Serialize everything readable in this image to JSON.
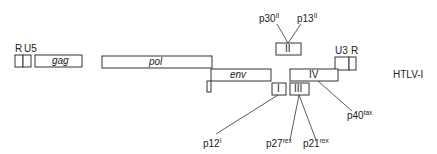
{
  "diagram": {
    "title": "HTLV-I",
    "genes": {
      "R_left": "R",
      "U5": "U5",
      "gag": "gag",
      "pol": "pol",
      "env": "env",
      "U3": "U3",
      "R_right": "R",
      "orf_I": "I",
      "orf_II": "II",
      "orf_III": "III",
      "orf_IV": "IV"
    },
    "proteins": {
      "p30": {
        "base": "p30",
        "sup": "II"
      },
      "p13": {
        "base": "p13",
        "sup": "II"
      },
      "p12": {
        "base": "p12",
        "sup": "I"
      },
      "p27": {
        "base": "p27",
        "sup": "rex"
      },
      "p21": {
        "base": "p21",
        "sup": "rex"
      },
      "p40": {
        "base": "p40",
        "sup": "tax"
      }
    }
  }
}
